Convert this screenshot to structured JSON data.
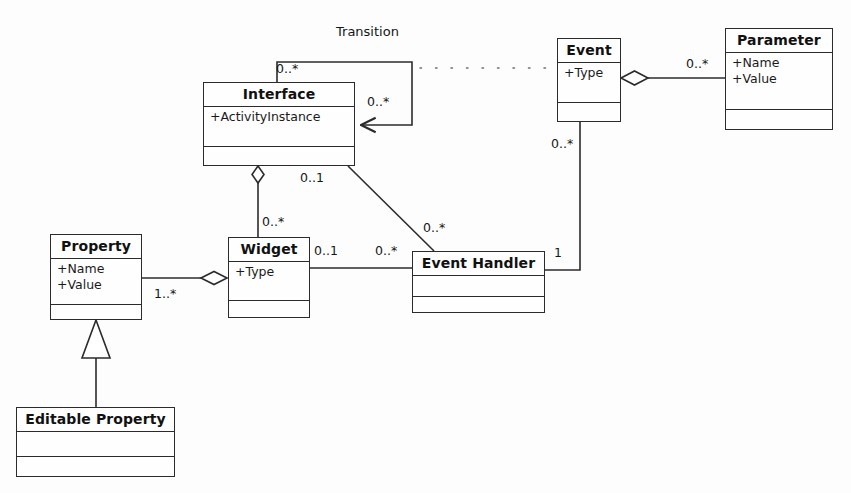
{
  "diagram": {
    "type": "uml-class-diagram",
    "title": "",
    "background_color": "#fdfdfd",
    "line_color": "#2b2b2b",
    "text_color": "#111111"
  },
  "classes": [
    {
      "id": "interface",
      "name": "Interface",
      "attributes": [
        "+ActivityInstance"
      ],
      "operations": [],
      "x": 203,
      "y": 82,
      "w": 152,
      "h": 84
    },
    {
      "id": "event",
      "name": "Event",
      "attributes": [
        "+Type"
      ],
      "operations": [],
      "x": 557,
      "y": 38,
      "w": 64,
      "h": 84
    },
    {
      "id": "parameter",
      "name": "Parameter",
      "attributes": [
        "+Name",
        "+Value"
      ],
      "operations": [],
      "x": 725,
      "y": 28,
      "w": 108,
      "h": 102
    },
    {
      "id": "property",
      "name": "Property",
      "attributes": [
        "+Name",
        "+Value"
      ],
      "operations": [],
      "x": 50,
      "y": 234,
      "w": 92,
      "h": 86
    },
    {
      "id": "widget",
      "name": "Widget",
      "attributes": [
        "+Type"
      ],
      "operations": [],
      "x": 228,
      "y": 237,
      "w": 82,
      "h": 81
    },
    {
      "id": "event-handler",
      "name": "Event Handler",
      "attributes": [],
      "operations": [],
      "x": 412,
      "y": 251,
      "w": 133,
      "h": 62
    },
    {
      "id": "editable-property",
      "name": "Editable Property",
      "attributes": [],
      "operations": [],
      "x": 16,
      "y": 407,
      "w": 159,
      "h": 70
    }
  ],
  "relationships": [
    {
      "id": "interface-transition",
      "kind": "association-directed",
      "label": "Transition",
      "source": "interface",
      "target": "interface",
      "source_multiplicity": "0..*",
      "target_multiplicity": "0..*"
    },
    {
      "id": "interface-event-handler",
      "kind": "association",
      "label": "",
      "source": "interface",
      "target": "event-handler",
      "source_multiplicity": "0..1",
      "target_multiplicity": "0..*"
    },
    {
      "id": "interface-widget",
      "kind": "aggregation",
      "label": "",
      "source": "interface",
      "target": "widget",
      "source_multiplicity": "",
      "target_multiplicity": "0..*"
    },
    {
      "id": "property-widget",
      "kind": "aggregation",
      "label": "",
      "source": "widget",
      "target": "property",
      "source_multiplicity": "",
      "target_multiplicity": "1..*"
    },
    {
      "id": "widget-event-handler",
      "kind": "association",
      "label": "",
      "source": "widget",
      "target": "event-handler",
      "source_multiplicity": "0..1",
      "target_multiplicity": "0..*"
    },
    {
      "id": "event-event-handler",
      "kind": "association",
      "label": "",
      "source": "event",
      "target": "event-handler",
      "source_multiplicity": "0..*",
      "target_multiplicity": "1"
    },
    {
      "id": "event-parameter",
      "kind": "aggregation",
      "label": "",
      "source": "event",
      "target": "parameter",
      "source_multiplicity": "",
      "target_multiplicity": "0..*"
    },
    {
      "id": "property-editable-property",
      "kind": "generalization",
      "label": "",
      "source": "editable-property",
      "target": "property",
      "source_multiplicity": "",
      "target_multiplicity": ""
    },
    {
      "id": "transition-event-dependency",
      "kind": "dependency-dotted",
      "label": "",
      "source": "interface-transition",
      "target": "event",
      "source_multiplicity": "",
      "target_multiplicity": ""
    }
  ],
  "labels": {
    "transition": "Transition",
    "interface_loop_top": "0..*",
    "interface_loop_right": "0..*",
    "interface_to_handler": "0..1",
    "handler_from_interface": "0..*",
    "widget_from_interface": "0..*",
    "widget_to_handler": "0..1",
    "handler_from_widget": "0..*",
    "property_to_widget": "1..*",
    "event_to_handler": "0..*",
    "handler_from_event": "1",
    "parameter_from_event": "0..*"
  }
}
